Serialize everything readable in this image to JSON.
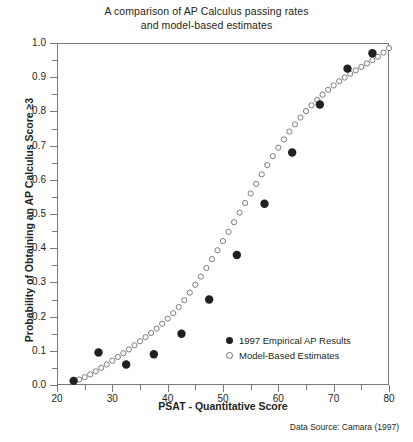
{
  "chart_data": {
    "type": "scatter",
    "title": "A comparison of AP Calculus passing rates and model-based estimates",
    "title_line1": "A comparison of AP Calculus passing rates",
    "title_line2": "and model-based estimates",
    "xlabel": "PSAT - Quantitative Score",
    "ylabel": "Probability of Obtaining an AP Calculus Score ≥3",
    "source_note": "Data Source: Camara (1997)",
    "xlim": [
      20,
      80
    ],
    "ylim": [
      0.0,
      1.0
    ],
    "xticks": [
      20,
      30,
      40,
      50,
      60,
      70,
      80
    ],
    "xtick_labels": [
      "20",
      "30",
      "40",
      "50",
      "60",
      "70",
      "80"
    ],
    "xminor_step": 5,
    "yticks": [
      0.0,
      0.1,
      0.2,
      0.3,
      0.4,
      0.5,
      0.6,
      0.7,
      0.8,
      0.9,
      1.0
    ],
    "ytick_labels": [
      "0.0",
      "0.1",
      "0.2",
      "0.3",
      "0.4",
      "0.5",
      "0.6",
      "0.7",
      "0.8",
      "0.9",
      "1.0"
    ],
    "yminor_step": 0.05,
    "grid": false,
    "legend_position": "bottom-right-inside",
    "marker_color_filled": "#231f20",
    "marker_color_open": "#6e6e6e",
    "frame_color": "#7a7a7a",
    "series": [
      {
        "name": "1997 Empirical AP Results",
        "marker": "filled-circle",
        "color": "#231f20",
        "points": [
          [
            23.0,
            0.012
          ],
          [
            27.5,
            0.095
          ],
          [
            32.5,
            0.06
          ],
          [
            37.5,
            0.09
          ],
          [
            42.5,
            0.15
          ],
          [
            47.5,
            0.25
          ],
          [
            52.5,
            0.38
          ],
          [
            57.5,
            0.53
          ],
          [
            62.5,
            0.68
          ],
          [
            67.5,
            0.82
          ],
          [
            72.5,
            0.925
          ],
          [
            77.0,
            0.97
          ]
        ]
      },
      {
        "name": "Model-Based Estimates",
        "marker": "open-circle",
        "color": "#6e6e6e",
        "points": [
          [
            23.0,
            0.01
          ],
          [
            24.0,
            0.016
          ],
          [
            25.0,
            0.023
          ],
          [
            26.0,
            0.031
          ],
          [
            27.0,
            0.04
          ],
          [
            28.0,
            0.05
          ],
          [
            29.0,
            0.06
          ],
          [
            30.0,
            0.071
          ],
          [
            31.0,
            0.082
          ],
          [
            32.0,
            0.093
          ],
          [
            33.0,
            0.104
          ],
          [
            34.0,
            0.116
          ],
          [
            35.0,
            0.128
          ],
          [
            36.0,
            0.14
          ],
          [
            37.0,
            0.152
          ],
          [
            38.0,
            0.165
          ],
          [
            39.0,
            0.179
          ],
          [
            40.0,
            0.194
          ],
          [
            41.0,
            0.21
          ],
          [
            42.0,
            0.228
          ],
          [
            43.0,
            0.248
          ],
          [
            44.0,
            0.27
          ],
          [
            45.0,
            0.293
          ],
          [
            46.0,
            0.317
          ],
          [
            47.0,
            0.342
          ],
          [
            48.0,
            0.368
          ],
          [
            49.0,
            0.394
          ],
          [
            50.0,
            0.421
          ],
          [
            51.0,
            0.448
          ],
          [
            52.0,
            0.476
          ],
          [
            53.0,
            0.504
          ],
          [
            54.0,
            0.532
          ],
          [
            55.0,
            0.56
          ],
          [
            56.0,
            0.588
          ],
          [
            57.0,
            0.616
          ],
          [
            58.0,
            0.643
          ],
          [
            59.0,
            0.669
          ],
          [
            60.0,
            0.694
          ],
          [
            61.0,
            0.718
          ],
          [
            62.0,
            0.741
          ],
          [
            63.0,
            0.762
          ],
          [
            64.0,
            0.782
          ],
          [
            65.0,
            0.801
          ],
          [
            66.0,
            0.818
          ],
          [
            67.0,
            0.834
          ],
          [
            68.0,
            0.849
          ],
          [
            69.0,
            0.863
          ],
          [
            70.0,
            0.876
          ],
          [
            71.0,
            0.888
          ],
          [
            72.0,
            0.899
          ],
          [
            73.0,
            0.91
          ],
          [
            74.0,
            0.92
          ],
          [
            75.0,
            0.93
          ],
          [
            76.0,
            0.94
          ],
          [
            77.0,
            0.95
          ],
          [
            78.0,
            0.96
          ],
          [
            79.0,
            0.972
          ],
          [
            80.0,
            0.985
          ]
        ]
      }
    ]
  },
  "legend": {
    "items": [
      {
        "label": "1997 Empirical AP Results",
        "marker": "filled-circle"
      },
      {
        "label": "Model-Based Estimates",
        "marker": "open-circle"
      }
    ]
  }
}
